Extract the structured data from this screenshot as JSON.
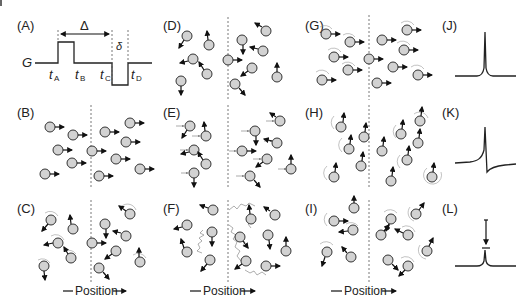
{
  "figure": {
    "panel_labels": [
      "(A)",
      "(B)",
      "(C)",
      "(D)",
      "(E)",
      "(F)",
      "(G)",
      "(H)",
      "(I)",
      "(J)",
      "(K)",
      "(L)"
    ],
    "pulse_sequence": {
      "gradient_label": "G",
      "delta_big": "Δ",
      "delta_small": "δ",
      "time_labels": [
        {
          "t": "t",
          "sub": "A"
        },
        {
          "t": "t",
          "sub": "B"
        },
        {
          "t": "t",
          "sub": "C"
        },
        {
          "t": "t",
          "sub": "D"
        }
      ]
    },
    "axis_labels": {
      "col1": "Position",
      "col2": "Position",
      "col3": "Position"
    },
    "panel_descriptions": {
      "B": "spins aligned in phase",
      "C": "spins precessing, dephased by gradient",
      "D": "spins dephased randomly",
      "E": "spins with phase memory arrows",
      "F": "spins diffused along random walk paths",
      "G": "spins refocused with precession rings",
      "H": "spins pointing up with precession rings",
      "I": "partially refocused spins after diffusion",
      "J": "full echo peak",
      "K": "dispersive signal",
      "L": "attenuated echo peak"
    },
    "colors": {
      "spin_fill": "#d2d2d2",
      "stroke": "#222222",
      "background": "#ffffff"
    }
  }
}
